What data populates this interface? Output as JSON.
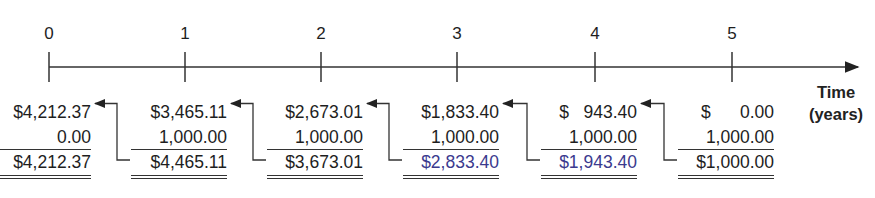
{
  "diagram": {
    "axis_label_line1": "Time",
    "axis_label_line2": "(years)",
    "highlight_color": "#3b3a8e",
    "periods": [
      {
        "t": "0",
        "x": 49,
        "start": "$4,212.37",
        "add": "0.00",
        "end": "$4,212.37",
        "end_highlight": false
      },
      {
        "t": "1",
        "x": 185,
        "start": "$3,465.11",
        "add": "1,000.00",
        "end": "$4,465.11",
        "end_highlight": false
      },
      {
        "t": "2",
        "x": 321,
        "start": "$2,673.01",
        "add": "1,000.00",
        "end": "$3,673.01",
        "end_highlight": false
      },
      {
        "t": "3",
        "x": 457,
        "start": "$1,833.40",
        "add": "1,000.00",
        "end": "$2,833.40",
        "end_highlight": true
      },
      {
        "t": "4",
        "x": 595,
        "start": "$   943.40",
        "add": "1,000.00",
        "end": "$1,943.40",
        "end_highlight": true
      },
      {
        "t": "5",
        "x": 732,
        "start": "$      0.00",
        "add": "1,000.00",
        "end": "$1,000.00",
        "end_highlight": false
      }
    ]
  }
}
